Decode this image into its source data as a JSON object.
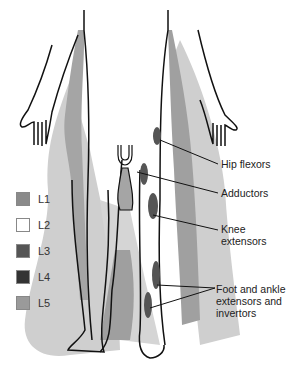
{
  "legend": {
    "items": [
      {
        "label": "L1",
        "color": "#8a8a8a"
      },
      {
        "label": "L2",
        "color": "#ffffff"
      },
      {
        "label": "L3",
        "color": "#555555"
      },
      {
        "label": "L4",
        "color": "#333333"
      },
      {
        "label": "L5",
        "color": "#9a9a9a"
      }
    ]
  },
  "callouts": {
    "hip_flexors": "Hip flexors",
    "adductors": "Adductors",
    "knee_extensors": "Knee\nextensors",
    "foot_ankle": "Foot and ankle\nextensors and\ninvertors"
  },
  "colors": {
    "light_zone": "#c8c8c8",
    "mid_zone": "#a0a0a0",
    "muscle": "#555555",
    "outline": "#111111"
  }
}
